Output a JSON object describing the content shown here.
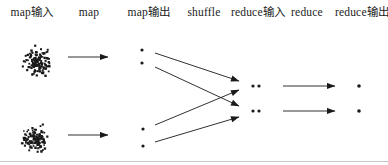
{
  "diagram": {
    "background_color": "#ffffff",
    "ink_color": "#1a1a1a",
    "bottom_rule_color": "#c6c6c6",
    "label_y": 13,
    "columns": [
      {
        "id": "map-input",
        "label": "map输入",
        "x": 32
      },
      {
        "id": "map",
        "label": "map",
        "x": 89
      },
      {
        "id": "map-output",
        "label": "map输出",
        "x": 149
      },
      {
        "id": "shuffle",
        "label": "shuffle",
        "x": 204
      },
      {
        "id": "reduce-input",
        "label": "reduce输入",
        "x": 258
      },
      {
        "id": "reduce",
        "label": "reduce",
        "x": 307
      },
      {
        "id": "reduce-output",
        "label": "reduce输出",
        "x": 362
      }
    ],
    "clusters": [
      {
        "name": "input-split-1",
        "cx": 37,
        "cy": 62,
        "rx": 20,
        "ry": 21,
        "points": 130,
        "seed": 7
      },
      {
        "name": "input-split-2",
        "cx": 35,
        "cy": 139,
        "rx": 20,
        "ry": 19,
        "points": 120,
        "seed": 41
      }
    ],
    "map_output_dots": [
      [
        142,
        50
      ],
      [
        142,
        63
      ],
      [
        143,
        129
      ],
      [
        143,
        146
      ]
    ],
    "reduce_input_pairs": [
      [
        [
          253,
          86
        ],
        [
          259,
          86
        ]
      ],
      [
        [
          253,
          111
        ],
        [
          259,
          111
        ]
      ]
    ],
    "reduce_output_dots": [
      [
        359,
        86
      ],
      [
        359,
        111
      ]
    ],
    "arrows": {
      "map": [
        [
          68,
          57,
          108,
          57
        ],
        [
          68,
          135,
          108,
          135
        ]
      ],
      "shuffle": [
        [
          155,
          53,
          239,
          81
        ],
        [
          155,
          67,
          239,
          106
        ],
        [
          155,
          125,
          239,
          90
        ],
        [
          155,
          142,
          239,
          117
        ]
      ],
      "reduce": [
        [
          283,
          86,
          335,
          86
        ],
        [
          283,
          111,
          335,
          111
        ]
      ]
    },
    "bottom_rule_y": 161
  }
}
